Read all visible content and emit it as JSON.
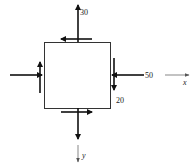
{
  "diagram": {
    "element": {
      "x": 44,
      "y": 42,
      "width": 66,
      "height": 66,
      "stroke": "#333333"
    },
    "labels": {
      "normal_y": "30",
      "normal_x": "50",
      "shear": "20",
      "axis_x": "x",
      "axis_y": "y"
    },
    "colors": {
      "arrow": "#111111",
      "axis": "#555555"
    }
  }
}
